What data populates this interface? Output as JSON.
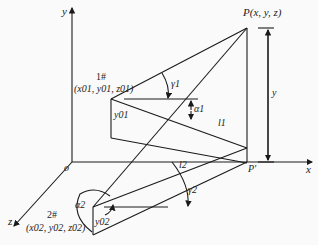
{
  "diagram": {
    "axes": {
      "x_label": "x",
      "y_label": "y",
      "z_label": "z",
      "origin_label": "o"
    },
    "point_P": {
      "label": "P(x, y, z)"
    },
    "point_P_prime": {
      "label": "P'"
    },
    "height_label": "y",
    "camera1": {
      "name": "1#",
      "coords": "(x01, y01, z01)",
      "height_label": "y01",
      "angle_gamma": "γ1",
      "angle_alpha": "α1",
      "line_label": "l1"
    },
    "camera2": {
      "name": "2#",
      "coords": "(x02, y02, z02)",
      "height_label": "y02",
      "angle_gamma": "γ2",
      "angle_alpha": "α2",
      "line_label": "l2"
    },
    "colors": {
      "line": "#1a1a1a",
      "background": "#fafafa"
    }
  }
}
